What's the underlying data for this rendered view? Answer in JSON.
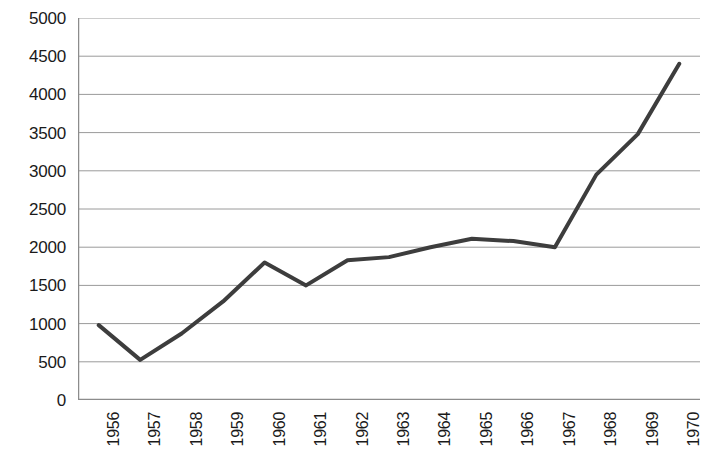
{
  "chart_data": {
    "type": "line",
    "title": "",
    "xlabel": "",
    "ylabel": "",
    "categories": [
      "1956",
      "1957",
      "1958",
      "1959",
      "1960",
      "1961",
      "1962",
      "1963",
      "1964",
      "1965",
      "1966",
      "1967",
      "1968",
      "1969",
      "1970"
    ],
    "values": [
      980,
      525,
      870,
      1290,
      1800,
      1500,
      1830,
      1870,
      2000,
      2110,
      2080,
      2000,
      2950,
      3480,
      4400
    ],
    "series": [
      {
        "name": "",
        "values": [
          980,
          525,
          870,
          1290,
          1800,
          1500,
          1830,
          1870,
          2000,
          2110,
          2080,
          2000,
          2950,
          3480,
          4400
        ]
      }
    ],
    "ylim": [
      0,
      5000
    ],
    "ytick_step": 500,
    "yticks": [
      0,
      500,
      1000,
      1500,
      2000,
      2500,
      3000,
      3500,
      4000,
      4500,
      5000
    ],
    "ytick_labels": [
      "0",
      "500",
      "1000",
      "1500",
      "2000",
      "2500",
      "3000",
      "3500",
      "4000",
      "4500",
      "5000"
    ],
    "grid": "horizontal",
    "legend": "none",
    "line_color": "#3d3d3d",
    "line_width": 4,
    "grid_color": "#9a9a9a",
    "axis_color": "#8c8c8c",
    "background_color": "#ffffff",
    "xtick_rotation": -90
  }
}
